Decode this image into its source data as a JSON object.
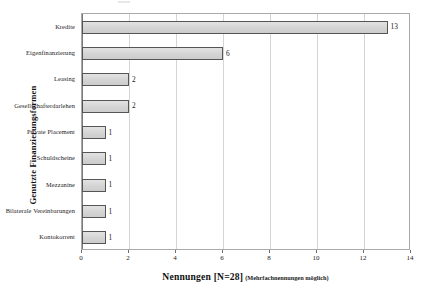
{
  "chart_data": {
    "type": "bar",
    "orientation": "horizontal",
    "title": "",
    "xlabel": "Nennungen [N=28]",
    "xlabel_note": "(Mehrfachnennungen möglich)",
    "ylabel": "Genutzte Finanzierungsformen",
    "categories": [
      "Kredite",
      "Eigenfinanzierung",
      "Leasing",
      "Gesellschafterdarlehen",
      "Private Placement",
      "Schuldscheine",
      "Mezzanine",
      "Bilaterale Vereinbarungen",
      "Kontokorrent"
    ],
    "values": [
      13,
      6,
      2,
      2,
      1,
      1,
      1,
      1,
      1
    ],
    "value_labels": [
      "13",
      "6",
      "2",
      "2",
      "1",
      "1",
      "1",
      "1",
      "1"
    ],
    "xlim": [
      0,
      14
    ],
    "xticks": [
      0,
      2,
      4,
      6,
      8,
      10,
      12,
      14
    ],
    "xtick_labels": [
      "0",
      "2",
      "4",
      "6",
      "8",
      "10",
      "12",
      "14"
    ],
    "grid": "vertical",
    "legend": "none",
    "bar_fill_color": "#d8d8d8",
    "bar_border_color": "#555555",
    "gridline_color": "#d5d5d5",
    "frame_color": "#a9a9a9",
    "background_color": "#ffffff",
    "text_color": "#1a1a1a"
  }
}
